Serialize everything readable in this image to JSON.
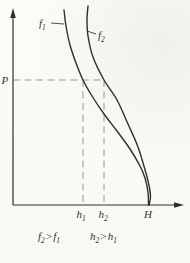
{
  "figure": {
    "background": "#fbfbf9",
    "line_color": "#2f2f2e",
    "dash_color": "#98988f",
    "text_color": "#33332f"
  },
  "labels": {
    "curve1_base": "f",
    "curve1_sub": "1",
    "curve2_base": "f",
    "curve2_sub": "2",
    "pressure": "P",
    "tick_h1_base": "h",
    "tick_h1_sub": "1",
    "tick_h2_base": "h",
    "tick_h2_sub": "2",
    "tick_H": "H"
  },
  "annotations": {
    "rel1": {
      "lhs_base": "f",
      "lhs_sub": "2",
      "op": ">",
      "rhs_base": "f",
      "rhs_sub": "1"
    },
    "rel2": {
      "lhs_base": "h",
      "lhs_sub": "2",
      "op": ">",
      "rhs_base": "h",
      "rhs_sub": "1"
    }
  },
  "chart_data": {
    "type": "line",
    "title": "",
    "xlabel": "",
    "ylabel": "",
    "grid": false,
    "legend": "curve labels f1 (left) and f2 (right) with leader lines",
    "x_tick_labels": [
      "h1",
      "h2",
      "H"
    ],
    "y_tick_labels": [
      "P"
    ],
    "relations": [
      "f2 > f1",
      "h2 > h1"
    ],
    "axes_px": {
      "origin": [
        13,
        205
      ],
      "x_arrow_tip": [
        184,
        205
      ],
      "y_arrow_tip": [
        13,
        9
      ]
    },
    "key_values_px": {
      "h1_x": 83,
      "h2_x": 104,
      "H_x": 148,
      "P_y": 80
    },
    "key_values_fraction_of_H": {
      "h1": 0.52,
      "h2": 0.67,
      "H": 1.0
    },
    "guides": [
      {
        "name": "p-dashed-line",
        "from": [
          13,
          80
        ],
        "to": [
          104,
          80
        ]
      },
      {
        "name": "h1-dashed-line",
        "from": [
          83,
          80
        ],
        "to": [
          83,
          204
        ]
      },
      {
        "name": "h2-dashed-line",
        "from": [
          104,
          80
        ],
        "to": [
          104,
          204
        ]
      }
    ],
    "series": [
      {
        "name": "f1",
        "points_px": [
          [
            64,
            10
          ],
          [
            66,
            26
          ],
          [
            70,
            45
          ],
          [
            76,
            63
          ],
          [
            83,
            80
          ],
          [
            92,
            96
          ],
          [
            104,
            114
          ],
          [
            117,
            131
          ],
          [
            130,
            149
          ],
          [
            140,
            166
          ],
          [
            145,
            178
          ],
          [
            148,
            192
          ],
          [
            148.5,
            205
          ]
        ]
      },
      {
        "name": "f2",
        "points_px": [
          [
            88,
            6
          ],
          [
            87,
            20
          ],
          [
            88,
            36
          ],
          [
            93,
            57
          ],
          [
            104,
            80
          ],
          [
            117,
            100
          ],
          [
            128,
            124
          ],
          [
            138,
            147
          ],
          [
            146.5,
            175
          ],
          [
            149.5,
            188
          ],
          [
            150.5,
            197
          ],
          [
            149,
            205
          ]
        ]
      }
    ]
  }
}
